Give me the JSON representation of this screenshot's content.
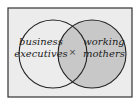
{
  "diagram": {
    "type": "venn",
    "frame": {
      "background": "#ececec",
      "border": "#333333"
    },
    "sets": [
      {
        "id": "left",
        "label_lines": [
          "business",
          "executives"
        ],
        "fill": "#ececec"
      },
      {
        "id": "right",
        "label_lines": [
          "working",
          "mothers"
        ],
        "fill": "#c8c8c8"
      }
    ],
    "intersection": {
      "marker": "×",
      "fill": "#c8c8c8"
    }
  }
}
